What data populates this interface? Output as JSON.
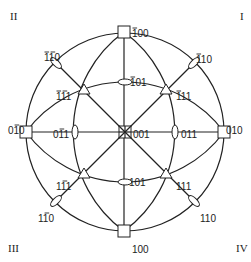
{
  "diagram": {
    "type": "stereographic-projection",
    "center": [
      125,
      132
    ],
    "radius": 99,
    "quadrants": [
      {
        "label": "I",
        "x": 240,
        "y": 20
      },
      {
        "label": "II",
        "x": 10,
        "y": 20
      },
      {
        "label": "III",
        "x": 8,
        "y": 252
      },
      {
        "label": "IV",
        "x": 236,
        "y": 252
      }
    ],
    "poles": [
      {
        "id": "001",
        "label": "001",
        "symbol": "square4",
        "x": 125,
        "y": 132,
        "lx": 133,
        "ly": 130,
        "bar": null
      },
      {
        "id": "-100",
        "label": "100",
        "bar_over": [
          0
        ],
        "symbol": "square",
        "x": 124,
        "y": 32,
        "lx": 132,
        "ly": 29
      },
      {
        "id": "100",
        "label": "100",
        "bar_over": [],
        "symbol": "square",
        "x": 124,
        "y": 231,
        "lx": 132,
        "ly": 245
      },
      {
        "id": "0-10",
        "label": "010",
        "bar_over": [
          1
        ],
        "symbol": "square",
        "x": 26,
        "y": 132,
        "lx": 8,
        "ly": 126
      },
      {
        "id": "010",
        "label": "010",
        "bar_over": [],
        "symbol": "square",
        "x": 224,
        "y": 132,
        "lx": 226,
        "ly": 126
      },
      {
        "id": "-101",
        "label": "101",
        "bar_over": [
          0
        ],
        "symbol": "ellipse-h",
        "x": 125,
        "y": 82,
        "lx": 130,
        "ly": 78
      },
      {
        "id": "101",
        "label": "101",
        "bar_over": [],
        "symbol": "ellipse-h",
        "x": 125,
        "y": 182,
        "lx": 129,
        "ly": 178
      },
      {
        "id": "0-11",
        "label": "011",
        "bar_over": [
          1
        ],
        "symbol": "ellipse-v",
        "x": 75,
        "y": 132,
        "lx": 53,
        "ly": 130
      },
      {
        "id": "011",
        "label": "011",
        "bar_over": [],
        "symbol": "ellipse-v",
        "x": 175,
        "y": 132,
        "lx": 181,
        "ly": 130
      },
      {
        "id": "-1-11",
        "label": "111",
        "bar_over": [
          0,
          1
        ],
        "symbol": "triangle",
        "x": 84,
        "y": 90,
        "lx": 56,
        "ly": 92
      },
      {
        "id": "-111",
        "label": "111",
        "bar_over": [
          0
        ],
        "symbol": "triangle",
        "x": 166,
        "y": 90,
        "lx": 176,
        "ly": 92
      },
      {
        "id": "1-11",
        "label": "111",
        "bar_over": [
          1
        ],
        "symbol": "triangle",
        "x": 84,
        "y": 174,
        "lx": 56,
        "ly": 182
      },
      {
        "id": "111",
        "label": "111",
        "bar_over": [],
        "symbol": "triangle",
        "x": 166,
        "y": 174,
        "lx": 176,
        "ly": 182
      },
      {
        "id": "-1-10",
        "label": "110",
        "bar_over": [
          0,
          1
        ],
        "symbol": "ellipse-d1",
        "x": 56,
        "y": 63,
        "lx": 44,
        "ly": 53
      },
      {
        "id": "-110",
        "label": "110",
        "bar_over": [
          0
        ],
        "symbol": "ellipse-d2",
        "x": 194,
        "y": 63,
        "lx": 196,
        "ly": 55
      },
      {
        "id": "1-10",
        "label": "110",
        "bar_over": [
          1
        ],
        "symbol": "ellipse-d2",
        "x": 56,
        "y": 201,
        "lx": 38,
        "ly": 214
      },
      {
        "id": "110",
        "label": "110",
        "bar_over": [],
        "symbol": "ellipse-d1",
        "x": 194,
        "y": 201,
        "lx": 200,
        "ly": 214
      }
    ]
  }
}
